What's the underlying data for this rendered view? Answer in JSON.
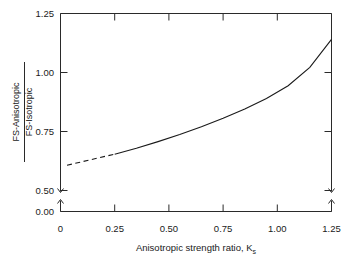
{
  "chart_data": {
    "type": "line",
    "title": "",
    "xlabel": "Anisotropic strength ratio, K",
    "xlabel_subscript": "s",
    "ylabel_numerator": "FS-Anisotropic",
    "ylabel_denominator": "FS-Isotropic",
    "xlim": [
      0,
      1.25
    ],
    "ylim": [
      0.5,
      1.25
    ],
    "y_axis_break": true,
    "y_break_from": 0.0,
    "y_break_to": 0.5,
    "grid": false,
    "legend": null,
    "xticks": [
      0,
      0.25,
      0.5,
      0.75,
      1.0,
      1.25
    ],
    "xtick_labels": [
      "0",
      "0.25",
      "0.50",
      "0.75",
      "1.00",
      "1.25"
    ],
    "yticks": [
      0.0,
      0.5,
      0.75,
      1.0,
      1.25
    ],
    "ytick_labels": [
      "0.00",
      "0.50",
      "0.75",
      "1.00",
      "1.25"
    ],
    "line_color": "#1a1a1a",
    "series": [
      {
        "name": "FS ratio vs anisotropic strength ratio",
        "style_segments": [
          {
            "style": "dashed",
            "x": [
              0.03,
              0.1,
              0.17,
              0.25
            ],
            "y": [
              0.607,
              0.622,
              0.637,
              0.654
            ]
          },
          {
            "style": "solid",
            "x": [
              0.25,
              0.35,
              0.45,
              0.55,
              0.65,
              0.75,
              0.85,
              0.95,
              1.05,
              1.15,
              1.25
            ],
            "y": [
              0.654,
              0.679,
              0.707,
              0.737,
              0.77,
              0.806,
              0.845,
              0.89,
              0.944,
              1.022,
              1.14
            ]
          }
        ]
      }
    ]
  }
}
